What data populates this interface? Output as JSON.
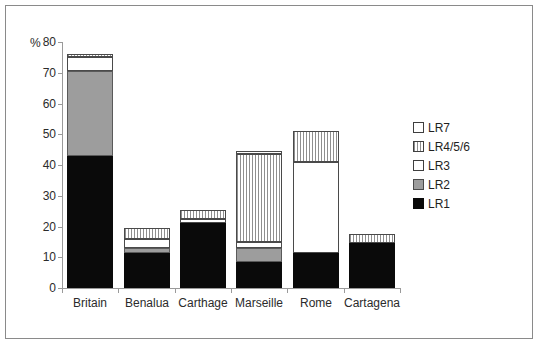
{
  "chart_data": {
    "type": "bar",
    "stacked": true,
    "title": "",
    "xlabel": "",
    "ylabel": "%",
    "ylim": [
      0,
      80
    ],
    "yticks": [
      0,
      10,
      20,
      30,
      40,
      50,
      60,
      70,
      80
    ],
    "grid": false,
    "legend_position": "right",
    "categories": [
      "Britain",
      "Benalua",
      "Carthage",
      "Marseille",
      "Rome",
      "Cartagena"
    ],
    "series": [
      {
        "name": "LR1",
        "values": [
          43.0,
          11.5,
          21.0,
          8.5,
          11.5,
          14.5
        ]
      },
      {
        "name": "LR2",
        "values": [
          27.5,
          1.5,
          0.0,
          4.5,
          0.0,
          0.0
        ]
      },
      {
        "name": "LR3",
        "values": [
          4.5,
          3.0,
          1.5,
          2.0,
          29.5,
          0.0
        ]
      },
      {
        "name": "LR4/5/6",
        "values": [
          1.0,
          3.5,
          3.0,
          28.5,
          10.0,
          3.0
        ]
      },
      {
        "name": "LR7",
        "values": [
          0.0,
          0.0,
          0.0,
          1.0,
          0.0,
          0.0
        ]
      }
    ],
    "totals": [
      76.0,
      19.5,
      25.5,
      44.5,
      51.0,
      17.5
    ],
    "legend": [
      {
        "label": "LR7",
        "key": "LR7",
        "swatch": "white-outline"
      },
      {
        "label": "LR4/5/6",
        "key": "LR456",
        "swatch": "vertical-hatch"
      },
      {
        "label": "LR3",
        "key": "LR3",
        "swatch": "white-outline"
      },
      {
        "label": "LR2",
        "key": "LR2",
        "swatch": "gray"
      },
      {
        "label": "LR1",
        "key": "LR1",
        "swatch": "black"
      }
    ],
    "colors": {
      "LR1": "#0a0a0a",
      "LR2": "#9d9d9d",
      "LR3": "#ffffff",
      "LR456": "#ffffff",
      "LR7": "#ffffff",
      "axis": "#9a9a9a",
      "frame": "#8a8a8a",
      "text": "#2b2b2b"
    }
  },
  "axis": {
    "y_unit_label": "%",
    "tick_labels": [
      "80",
      "70",
      "60",
      "50",
      "40",
      "30",
      "20",
      "10",
      "0"
    ]
  }
}
